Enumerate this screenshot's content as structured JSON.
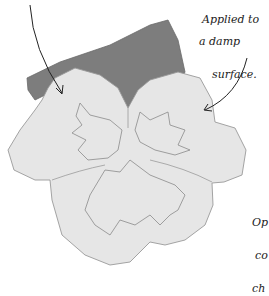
{
  "illustration": {
    "subject": "pansy flower watercolor sketch",
    "colors": {
      "background": "#ffffff",
      "upper_petal_wash": "#7d7d7d",
      "lower_petals": "#e6e6e6",
      "outline": "#8a8a8a",
      "ink": "#222222"
    }
  },
  "annotations": {
    "damp_surface": {
      "line1": "Applied to",
      "line2": "a damp",
      "line3": "surface."
    },
    "side_note": {
      "line1": "Op",
      "line2": "co",
      "line3": "ch"
    }
  }
}
